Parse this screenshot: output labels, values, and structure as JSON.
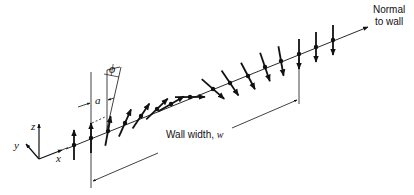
{
  "figure": {
    "type": "domain-wall-spin-rotation",
    "labels": {
      "normal_line1": "Normal",
      "normal_line2": "to wall",
      "wall_width": "Wall width,",
      "wall_width_symbol": "w",
      "axis_x": "x",
      "axis_y": "y",
      "axis_z": "z",
      "angle": "ϕ",
      "spacing": "a"
    },
    "colors": {
      "ink": "#111111",
      "background": "#ffffff"
    },
    "spins": [
      {
        "x": 74,
        "y": 145,
        "angle": 0
      },
      {
        "x": 91,
        "y": 138,
        "angle": 0
      },
      {
        "x": 108,
        "y": 131,
        "angle": 12
      },
      {
        "x": 125,
        "y": 123,
        "angle": 30
      },
      {
        "x": 141,
        "y": 116,
        "angle": 45
      },
      {
        "x": 157,
        "y": 109,
        "angle": 62
      },
      {
        "x": 171,
        "y": 104,
        "angle": 80
      },
      {
        "x": 190,
        "y": 97,
        "angle": 110
      },
      {
        "x": 213,
        "y": 89,
        "angle": 140
      },
      {
        "x": 230,
        "y": 83,
        "angle": 150
      },
      {
        "x": 248,
        "y": 76,
        "angle": 155
      },
      {
        "x": 265,
        "y": 67,
        "angle": 162
      },
      {
        "x": 281,
        "y": 61,
        "angle": 170
      },
      {
        "x": 299,
        "y": 54,
        "angle": 180
      },
      {
        "x": 316,
        "y": 47,
        "angle": 180
      },
      {
        "x": 333,
        "y": 40,
        "angle": 180
      }
    ]
  }
}
